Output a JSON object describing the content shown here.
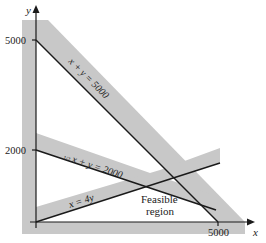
{
  "figure": {
    "type": "linear-programming-feasible-region",
    "axes": {
      "x_label": "x",
      "y_label": "y",
      "y_ticks": [
        "5000",
        "2000"
      ],
      "x_ticks": [
        "5000"
      ]
    },
    "constraints": [
      {
        "id": "c1",
        "label": "x + y = 5000"
      },
      {
        "id": "c2",
        "label_fraction": "1/2",
        "label_rest": "x + y = 2000"
      },
      {
        "id": "c3",
        "label": "x = 4y"
      }
    ],
    "region_label_line1": "Feasible",
    "region_label_line2": "region",
    "colors": {
      "band": "#c8c8c8",
      "line": "#1a1a1a",
      "background": "#ffffff"
    }
  }
}
